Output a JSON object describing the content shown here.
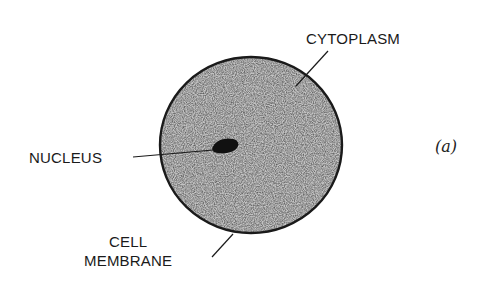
{
  "figure": {
    "panel_label": "(a)",
    "labels": {
      "cytoplasm": "CYTOPLASM",
      "nucleus": "NUCLEUS",
      "cell_membrane_line1": "CELL",
      "cell_membrane_line2": "MEMBRANE"
    },
    "colors": {
      "background": "#ffffff",
      "cytoplasm_fill": "#b8b8b8",
      "membrane_stroke": "#1a1a1a",
      "nucleus_fill": "#111111",
      "text": "#1a1a1a"
    }
  }
}
